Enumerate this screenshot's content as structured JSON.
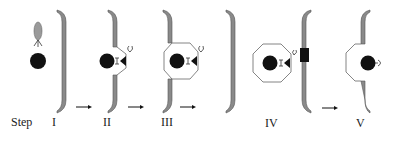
{
  "figure": {
    "type": "process-diagram",
    "row_label": "Step",
    "steps": [
      {
        "id": "I",
        "label": "I",
        "state": "free particle with ellipsoid receptor complex approaching membrane"
      },
      {
        "id": "II",
        "label": "II",
        "state": "particle docked to membrane indentation via receptor"
      },
      {
        "id": "III",
        "label": "III",
        "state": "membrane engulfs particle into octagonal vesicle"
      },
      {
        "id": "IV",
        "label": "IV",
        "state": "vesicle released, attaches to opposite membrane at dark docking block"
      },
      {
        "id": "V",
        "label": "V",
        "state": "vesicle fuses with opposite membrane, particle exposed"
      }
    ],
    "arrows": [
      {
        "from": "I",
        "to": "II"
      },
      {
        "from": "II",
        "to": "III"
      },
      {
        "from": "III",
        "to": "IV"
      },
      {
        "from": "IV",
        "to": "V"
      }
    ],
    "colors": {
      "membrane": "#8a8a8a",
      "particle": "#111111",
      "vesicle_outline": "#777777",
      "text": "#222222",
      "background": "#ffffff"
    }
  }
}
